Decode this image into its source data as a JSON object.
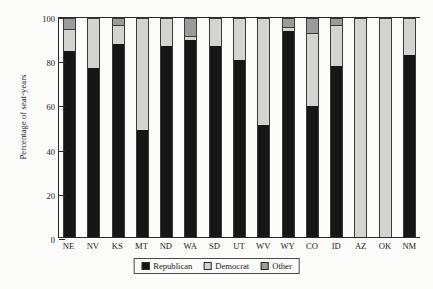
{
  "chart_data": {
    "type": "bar",
    "stacked": true,
    "title": "",
    "xlabel": "",
    "ylabel": "Percentage of seat-years",
    "ylim": [
      0,
      100
    ],
    "yticks": [
      0,
      20,
      40,
      60,
      80,
      100
    ],
    "grid": false,
    "legend_position": "bottom-center",
    "categories": [
      "NE",
      "NV",
      "KS",
      "MT",
      "ND",
      "WA",
      "SD",
      "UT",
      "WV",
      "WY",
      "CO",
      "ID",
      "AZ",
      "OK",
      "NM"
    ],
    "series": [
      {
        "name": "Republican",
        "color": "#161616",
        "values": [
          85,
          77,
          88,
          49,
          87,
          90,
          87,
          81,
          51,
          94,
          60,
          78,
          0,
          0,
          83
        ]
      },
      {
        "name": "Democrat",
        "color": "#d3d3d1",
        "values": [
          10,
          23,
          9,
          51,
          13,
          2,
          13,
          19,
          49,
          2,
          33,
          19,
          100,
          100,
          17
        ]
      },
      {
        "name": "Other",
        "color": "#9b9b9b",
        "values": [
          5,
          0,
          3,
          0,
          0,
          8,
          0,
          0,
          0,
          4,
          7,
          3,
          0,
          0,
          0
        ]
      }
    ]
  },
  "legend": {
    "items": [
      {
        "label": "Republican",
        "swatch": "rep"
      },
      {
        "label": "Democrat",
        "swatch": "dem"
      },
      {
        "label": "Other",
        "swatch": "oth"
      }
    ]
  }
}
